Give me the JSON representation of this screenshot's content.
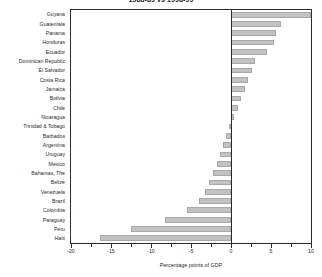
{
  "chart_data": {
    "type": "bar",
    "orientation": "horizontal",
    "title": "1988-89 vs 1998-99",
    "xlabel": "Percentage points of GDP",
    "ylabel": "",
    "xlim": [
      -20,
      10
    ],
    "xticks": [
      -20,
      -15,
      -10,
      -5,
      0,
      5,
      10
    ],
    "xtick_labels": [
      "-20",
      "-15",
      "-10",
      "-5",
      "0",
      "5",
      "10"
    ],
    "minor_ticks": [
      -17.5,
      -12.5,
      -7.5,
      -2.5,
      2.5,
      7.5
    ],
    "grid": false,
    "legend": "none",
    "bar_color": "#c2c2c2",
    "bar_edge_color": "#a9a9a9",
    "axis_color": "#2b2b2b",
    "categories": [
      "Guyana",
      "Guatemala",
      "Panama",
      "Honduras",
      "Ecuador",
      "Dominican Republic",
      "El Salvador",
      "Costa Rica",
      "Jamaica",
      "Bolivia",
      "Chile",
      "Nicaragua",
      "Trinidad & Tobago",
      "Barbados",
      "Argentina",
      "Uruguay",
      "Mexico",
      "Bahamas, The",
      "Belize",
      "Venezuela",
      "Brazil",
      "Colombia",
      "Paraguay",
      "Peru",
      "Haiti"
    ],
    "values": [
      10.0,
      6.3,
      5.6,
      5.4,
      4.5,
      3.0,
      2.6,
      2.1,
      1.7,
      1.3,
      0.9,
      0.4,
      -0.2,
      -0.6,
      -1.0,
      -1.4,
      -1.8,
      -2.3,
      -2.7,
      -3.2,
      -4.0,
      -5.5,
      -8.3,
      -12.5,
      -16.4
    ]
  }
}
